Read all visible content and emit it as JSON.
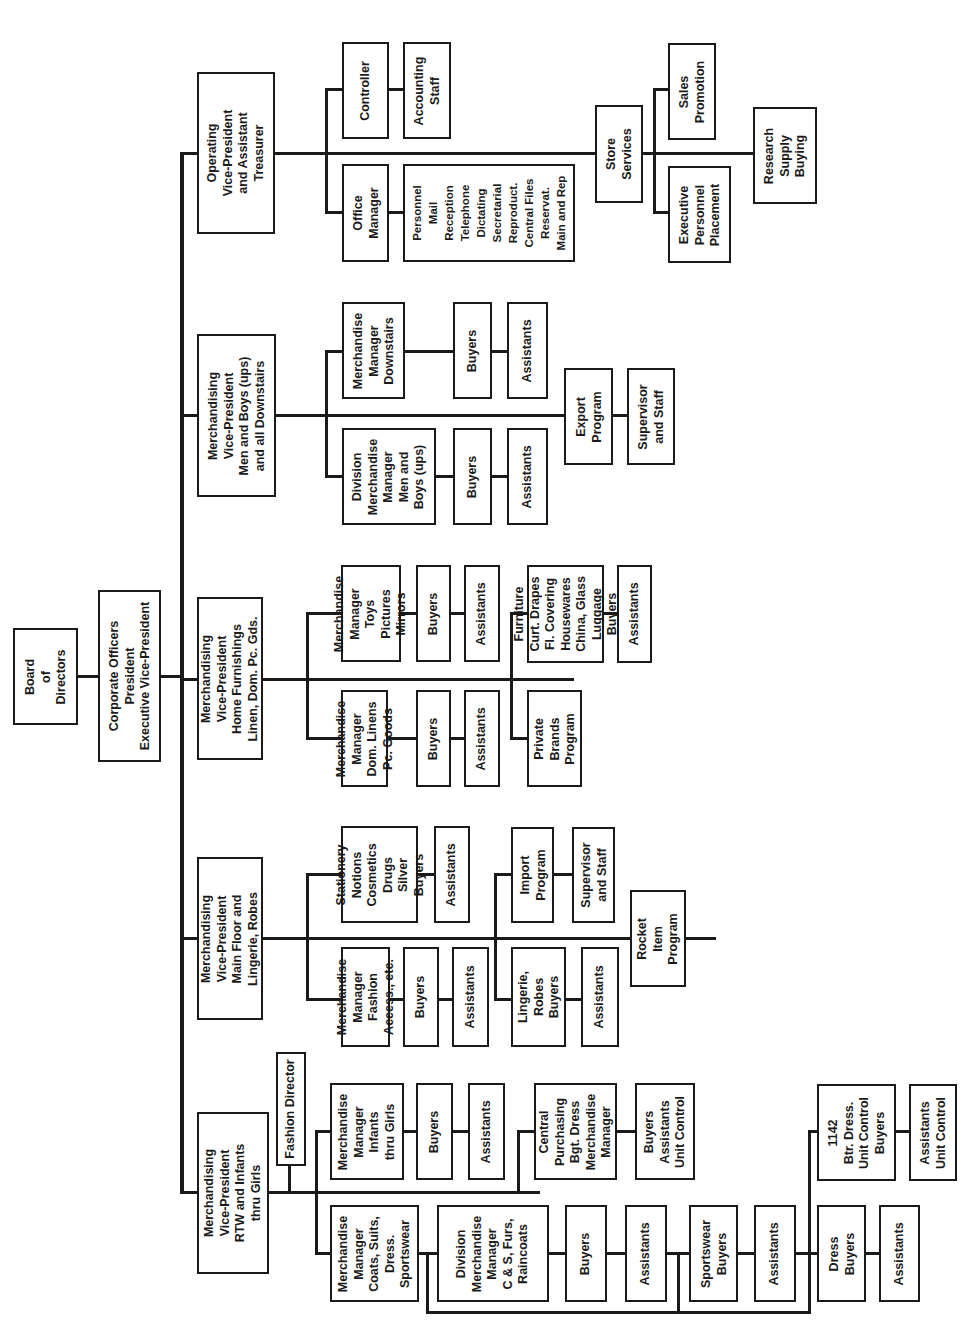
{
  "chart": {
    "orientation": "rotated 90deg counter-clockwise",
    "line_color": "#1a1a1a",
    "nodes": {
      "board": "Board\nof\nDirectors",
      "corporate": "Corporate Officers\nPresident\nExecutive Vice-President",
      "vp_operating": "Operating\nVice-President\nand Assistant\nTreasurer",
      "controller": "Controller",
      "accounting_staff": "Accounting\nStaff",
      "office_manager": "Office\nManager",
      "office_services": "Personnel\nMail\nReception\nTelephone\nDictating\nSecretarial\nReproduct.\nCentral Files\nReservat.\nMain and Rep",
      "store_services": "Store\nServices",
      "sales_promotion": "Sales\nPromotion",
      "exec_personnel": "Executive\nPersonnel\nPlacement",
      "research_supply": "Research\nSupply\nBuying",
      "vp_men": "Merchandising\nVice-President\nMen and Boys (ups)\nand all Downstairs",
      "mm_downstairs": "Merchandise\nManager\nDownstairs",
      "buyers_downstairs": "Buyers",
      "assistants_downstairs": "Assistants",
      "dmm_men": "Division\nMerchandise\nManager\nMen and\nBoys (ups)",
      "buyers_men": "Buyers",
      "assistants_men": "Assistants",
      "export_program": "Export\nProgram",
      "export_staff": "Supervisor\nand Staff",
      "vp_home": "Merchandising\nVice-President\nHome Furnishings\nLinen, Dom. Pc. Gds.",
      "mm_toys": "Merchandise\nManager\nToys\nPictures\nMirrors",
      "buyers_toys": "Buyers",
      "assistants_toys": "Assistants",
      "mm_linens": "Merchandise\nManager\nDom. Linens\nPc. Goods",
      "buyers_linens": "Buyers",
      "assistants_linens": "Assistants",
      "furniture_buyers": "Furniture\nCurt. Drapes\nFl. Covering\nHousewares\nChina, Glass\nLuggage\nBuyers",
      "assistants_furniture": "Assistants",
      "private_brands": "Private\nBrands\nProgram",
      "vp_main": "Merchandising\nVice-President\nMain Floor and\nLingerie, Robes",
      "stationery_buyers": "Stationery\nNotions\nCosmetics\nDrugs\nSilver\nBuyers",
      "assistants_stationery": "Assistants",
      "mm_fashion": "Merchandise\nManager\nFashion\nAccess., etc.",
      "buyers_fashion": "Buyers",
      "assistants_fashion": "Assistants",
      "import_program": "Import\nProgram",
      "import_staff": "Supervisor\nand Staff",
      "lingerie_buyers": "Lingerie,\nRobes\nBuyers",
      "assistants_lingerie": "Assistants",
      "rocket_item": "Rocket\nItem\nProgram",
      "vp_rtw": "Merchandising\nVice-President\nRTW and Infants\nthru Girls",
      "fashion_director": "Fashion Director",
      "mm_infants": "Merchandise\nManager\nInfants\nthru Girls",
      "buyers_infants": "Buyers",
      "assistants_infants": "Assistants",
      "central_purchasing": "Central\nPurchasing\nBgt. Dress\nMerchandise\nManager",
      "cp_staff": "Buyers\nAssistants\nUnit Control",
      "mm_coats": "Merchandise\nManager\nCoats, Suits,\nDress.\nSportswear",
      "dmm_coats": "Division\nMerchandise\nManager\nC & S, Furs,\nRaincoats",
      "buyers_coats": "Buyers",
      "assistants_coats": "Assistants",
      "sportswear_buyers": "Sportswear\nBuyers",
      "assistants_sportswear": "Assistants",
      "btr_dress": "1142\nBtr. Dress.\nUnit Control\nBuyers",
      "assistants_btr": "Assistants\nUnit Control",
      "dress_buyers": "Dress\nBuyers",
      "assistants_dress": "Assistants"
    }
  }
}
